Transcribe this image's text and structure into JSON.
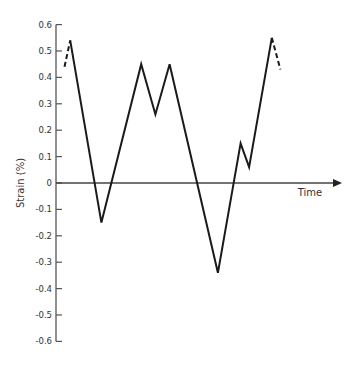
{
  "chart_data": {
    "type": "line",
    "title": "",
    "xlabel": "Time",
    "ylabel": "Strain (%)",
    "ylim": [
      -0.6,
      0.6
    ],
    "yticks": [
      "0.6",
      "0.5",
      "0.4",
      "0.3",
      "0.2",
      "0.1",
      "0",
      "-0.1",
      "-0.2",
      "-0.3",
      "-0.4",
      "-0.5",
      "-0.6"
    ],
    "grid": false,
    "legend": null,
    "series": [
      {
        "name": "strain history",
        "style": "solid",
        "points": [
          {
            "t": 0.05,
            "strain": 0.54
          },
          {
            "t": 0.16,
            "strain": -0.15
          },
          {
            "t": 0.3,
            "strain": 0.45
          },
          {
            "t": 0.35,
            "strain": 0.26
          },
          {
            "t": 0.4,
            "strain": 0.45
          },
          {
            "t": 0.57,
            "strain": -0.34
          },
          {
            "t": 0.65,
            "strain": 0.15
          },
          {
            "t": 0.68,
            "strain": 0.06
          },
          {
            "t": 0.76,
            "strain": 0.55
          }
        ]
      },
      {
        "name": "continuation (start)",
        "style": "dashed",
        "points": [
          {
            "t": 0.03,
            "strain": 0.44
          },
          {
            "t": 0.05,
            "strain": 0.54
          }
        ]
      },
      {
        "name": "continuation (end)",
        "style": "dashed",
        "points": [
          {
            "t": 0.76,
            "strain": 0.55
          },
          {
            "t": 0.79,
            "strain": 0.43
          }
        ]
      }
    ]
  }
}
